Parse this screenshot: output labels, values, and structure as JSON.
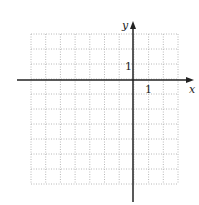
{
  "diagram": {
    "type": "coordinate-grid",
    "grid": {
      "cols": 10,
      "rows": 10,
      "x_range": [
        -7,
        3
      ],
      "y_range": [
        -7,
        3
      ],
      "line_style": "dotted",
      "color": "#b8b8b8"
    },
    "axes": {
      "x_label": "x",
      "y_label": "y",
      "color": "#222222"
    },
    "tick_labels": {
      "x_unit": "1",
      "y_unit": "1"
    }
  }
}
